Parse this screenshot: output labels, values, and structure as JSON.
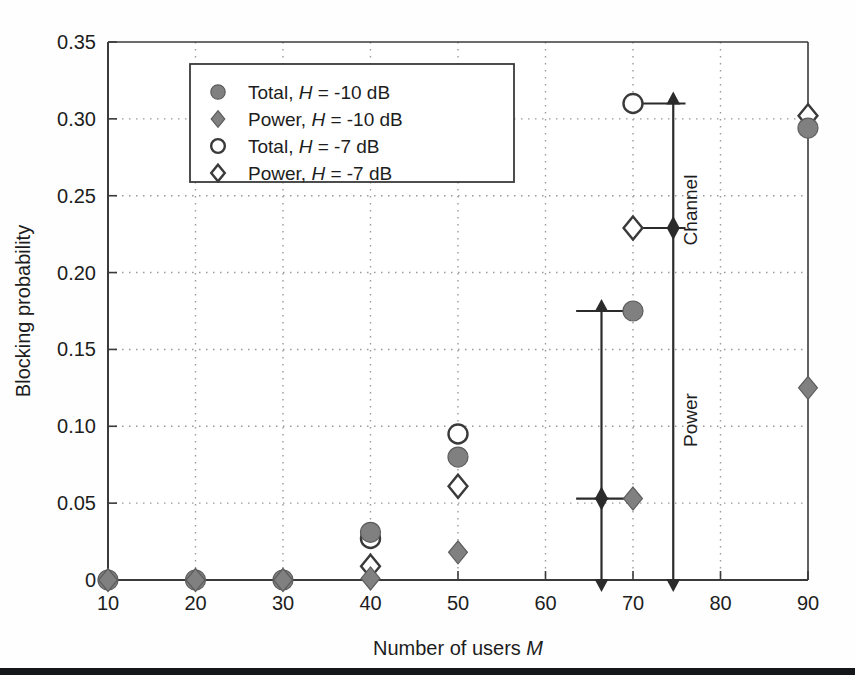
{
  "figure": {
    "background_color": "#fefefe",
    "axis_color": "#3a3a3a",
    "grid_color": "#9a9a9a",
    "marker_fill_color": "#808080",
    "marker_open_color": "#ffffff",
    "marker_edge_color": "#3a3a3a",
    "annotation_color": "#2b2b2b",
    "rule_color": "#15161a"
  },
  "chart_data": {
    "type": "scatter",
    "title": "",
    "xlabel": "Number of users M",
    "ylabel": "Blocking probability",
    "xlim": [
      10,
      90
    ],
    "ylim": [
      0,
      0.35
    ],
    "xticks": [
      10,
      20,
      30,
      40,
      50,
      60,
      70,
      80,
      90
    ],
    "xticklabels": [
      "10",
      "20",
      "30",
      "40",
      "50",
      "60",
      "70",
      "80",
      "90"
    ],
    "yticks": [
      0,
      0.05,
      0.1,
      0.15,
      0.2,
      0.25,
      0.3,
      0.35
    ],
    "yticklabels": [
      "0",
      "0.05",
      "0.10",
      "0.15",
      "0.20",
      "0.25",
      "0.30",
      "0.35"
    ],
    "grid": true,
    "grid_style": "dotted",
    "legend_position": "upper left",
    "series": [
      {
        "name": "Total, H = -10 dB",
        "marker": "filled-circle",
        "x": [
          10,
          20,
          30,
          40,
          50,
          70,
          90
        ],
        "y": [
          0.0,
          0.0,
          0.0,
          0.031,
          0.08,
          0.175,
          0.294
        ]
      },
      {
        "name": "Power, H = -10 dB",
        "marker": "filled-diamond",
        "x": [
          10,
          20,
          30,
          40,
          50,
          70,
          90
        ],
        "y": [
          0.0,
          0.0,
          0.0,
          0.001,
          0.018,
          0.053,
          0.125
        ]
      },
      {
        "name": "Total, H = -7 dB",
        "marker": "open-circle",
        "x": [
          40,
          50,
          70
        ],
        "y": [
          0.027,
          0.095,
          0.31
        ]
      },
      {
        "name": "Power, H = -7 dB",
        "marker": "open-diamond",
        "x": [
          40,
          50,
          70,
          90
        ],
        "y": [
          0.009,
          0.061,
          0.229,
          0.302
        ]
      }
    ],
    "annotations": [
      {
        "label": "Channel",
        "type": "double-arrow-vertical",
        "x": 74.6,
        "y_from": 0.229,
        "y_to": 0.31,
        "reference_lines": [
          {
            "y": 0.31,
            "x_from": 69.2,
            "x_to": 76.0
          },
          {
            "y": 0.229,
            "x_from": 69.2,
            "x_to": 76.0
          }
        ]
      },
      {
        "label": "Power",
        "type": "double-arrow-vertical",
        "x": 66.4,
        "y_from": 0.053,
        "y_to": 0.175,
        "reference_lines": [
          {
            "y": 0.175,
            "x_from": 63.5,
            "x_to": 71.0
          },
          {
            "y": 0.053,
            "x_from": 63.5,
            "x_to": 71.0
          }
        ]
      }
    ]
  },
  "legend": {
    "items": [
      {
        "marker": "filled-circle",
        "label_prefix": "Total, ",
        "label_var": "H",
        "label_suffix": " = -10 dB"
      },
      {
        "marker": "filled-diamond",
        "label_prefix": "Power, ",
        "label_var": "H",
        "label_suffix": " = -10 dB"
      },
      {
        "marker": "open-circle",
        "label_prefix": "Total, ",
        "label_var": "H",
        "label_suffix": " = -7 dB"
      },
      {
        "marker": "open-diamond",
        "label_prefix": "Power, ",
        "label_var": "H",
        "label_suffix": " = -7 dB"
      }
    ]
  },
  "axis_titles": {
    "x_prefix": "Number of users ",
    "x_var": "M",
    "y": "Blocking probability"
  },
  "annotation_labels": {
    "channel": "Channel",
    "power": "Power"
  }
}
